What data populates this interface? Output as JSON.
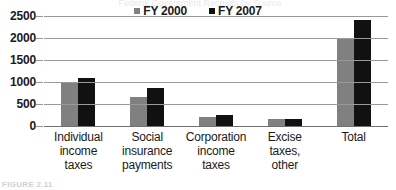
{
  "figure": {
    "title_remnant": "Federal Government Receipts by Source",
    "caption_remnant": "FIGURE 2.11"
  },
  "chart_data": {
    "type": "bar",
    "title": "",
    "xlabel": "",
    "ylabel": "",
    "categories": [
      "Individual income taxes",
      "Social insurance payments",
      "Corporation income taxes",
      "Excise taxes, other",
      "Total"
    ],
    "category_lines": [
      [
        "Individual",
        "income",
        "taxes"
      ],
      [
        "Social",
        "insurance",
        "payments"
      ],
      [
        "Corporation",
        "income",
        "taxes"
      ],
      [
        "Excise",
        "taxes,",
        "other"
      ],
      [
        "Total"
      ]
    ],
    "series": [
      {
        "name": "FY 2000",
        "color": "#808080",
        "values": [
          1000,
          650,
          200,
          150,
          2000
        ]
      },
      {
        "name": "FY 2007",
        "color": "#111111",
        "values": [
          1090,
          870,
          250,
          155,
          2400
        ]
      }
    ],
    "ylim": [
      0,
      2500
    ],
    "yticks": [
      0,
      500,
      1000,
      1500,
      2000,
      2500
    ],
    "ytick_labels": [
      "0",
      "500",
      "1000",
      "1500",
      "2000",
      "2500"
    ],
    "grid": true,
    "legend_position": "top-center"
  }
}
